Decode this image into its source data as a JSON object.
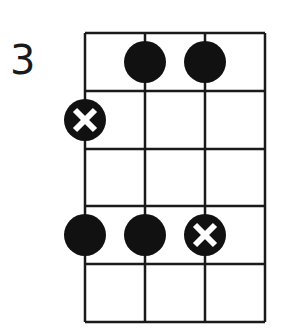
{
  "diagram": {
    "type": "chord-fretboard",
    "start_fret_label": "3",
    "strings": 4,
    "frets_shown": 5,
    "colors": {
      "line": "#1a1a1a",
      "dot": "#111111",
      "x_mark": "#ffffff",
      "background": "#ffffff"
    },
    "markers": [
      {
        "string": 2,
        "fret": 1,
        "kind": "dot"
      },
      {
        "string": 3,
        "fret": 1,
        "kind": "dot"
      },
      {
        "string": 1,
        "fret": 2,
        "kind": "x-dot"
      },
      {
        "string": 1,
        "fret": 4,
        "kind": "dot"
      },
      {
        "string": 2,
        "fret": 4,
        "kind": "dot"
      },
      {
        "string": 3,
        "fret": 4,
        "kind": "x-dot"
      }
    ]
  }
}
